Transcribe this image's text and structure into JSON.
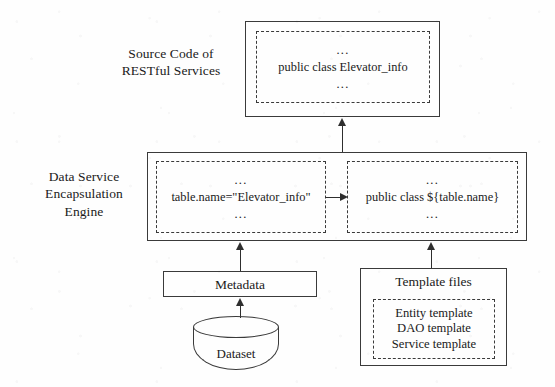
{
  "diagram": {
    "stroke_color": "#3a3a3a",
    "background_color": "#ffffff"
  },
  "layers": {
    "top": {
      "side_label": "Source Code of\nRESTful Services",
      "code_box": {
        "dots_top": "...",
        "code": "public class Elevator_info",
        "dots_bottom": "..."
      }
    },
    "middle": {
      "side_label": "Data Service\nEncapsulation\nEngine",
      "left_box": {
        "dots_top": "...",
        "code": "table.name=\"Elevator_info\"",
        "dots_bottom": "..."
      },
      "right_box": {
        "dots_top": "...",
        "code": "public class ${table.name}",
        "dots_bottom": "..."
      }
    },
    "bottom": {
      "metadata": {
        "label": "Metadata"
      },
      "dataset": {
        "label": "Dataset"
      },
      "template_files": {
        "label": "Template files",
        "items": [
          "Entity template",
          "DAO template",
          "Service template"
        ]
      }
    }
  },
  "arrows": [
    {
      "name": "engine-to-source-code",
      "direction": "up"
    },
    {
      "name": "metadata-to-left-box",
      "direction": "up"
    },
    {
      "name": "template-files-to-right-box",
      "direction": "up"
    },
    {
      "name": "dataset-to-metadata",
      "direction": "up"
    },
    {
      "name": "left-box-to-right-box",
      "direction": "right"
    }
  ]
}
